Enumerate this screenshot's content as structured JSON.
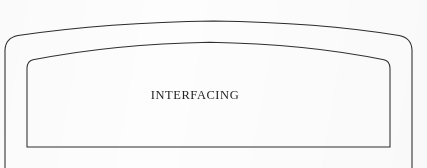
{
  "figure": {
    "kind": "line-drawing",
    "background_color": "#fdfdfd",
    "stroke_color": "#2b2b2b",
    "label_color": "#242424",
    "label": "INTERFACING",
    "shapes": [
      {
        "name": "outer-arched-outline",
        "arc_peak_y": 22,
        "left_edge_x": 5,
        "right_edge_x": 412,
        "corner_radius": 14
      },
      {
        "name": "inner-arched-outline",
        "arc_peak_y": 42,
        "left_edge_x": 27,
        "right_edge_x": 390,
        "bottom_edge_y": 147,
        "corner_radius": 3
      }
    ]
  },
  "canvas": {
    "width": 427,
    "height": 168
  }
}
